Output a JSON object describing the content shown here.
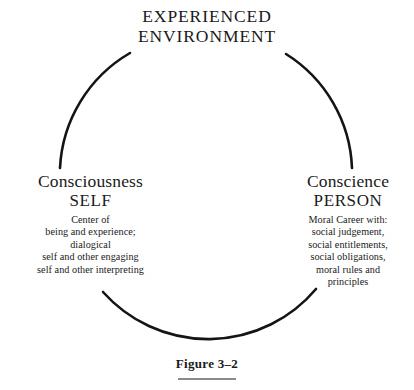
{
  "figure": {
    "caption": "Figure 3–2",
    "rule_color": "#8a8a8a",
    "stroke_color": "#141414",
    "background": "#ffffff"
  },
  "diagram": {
    "type": "cycle",
    "shape": "broken-circle",
    "center": {
      "x": 206,
      "y": 192
    },
    "radius": 141,
    "arcs": [
      {
        "name": "top-left-arc",
        "start_deg": 180,
        "end_deg": 242
      },
      {
        "name": "top-right-arc",
        "start_deg": 298,
        "end_deg": 360
      },
      {
        "name": "bottom-arc",
        "start_deg": 43,
        "end_deg": 137
      }
    ],
    "nodes": {
      "environment": {
        "lines": [
          "EXPERIENCED",
          "ENVIRONMENT"
        ]
      },
      "consciousness": {
        "title": "Consciousness",
        "subtitle": "SELF",
        "body": [
          "Center of",
          "being and experience;",
          "dialogical",
          "self and other engaging",
          "self and other interpreting"
        ]
      },
      "conscience": {
        "title": "Conscience",
        "subtitle": "PERSON",
        "body": [
          "Moral Career with:",
          "social judgement,",
          "social entitlements,",
          "social obligations,",
          "moral rules and",
          "principles"
        ]
      }
    }
  }
}
